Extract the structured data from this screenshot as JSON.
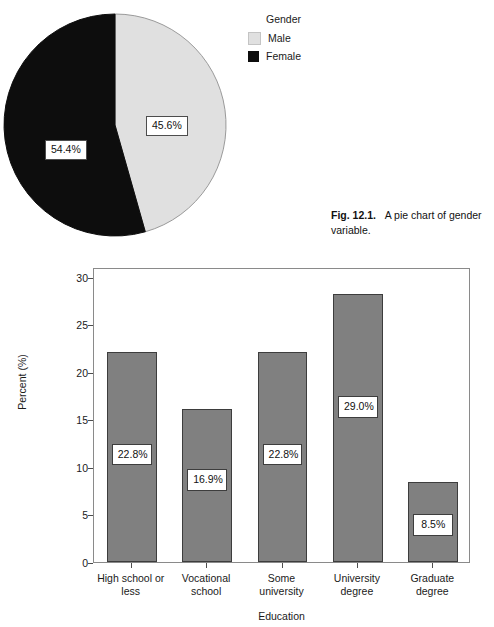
{
  "pie_figure": {
    "legend": {
      "title": "Gender",
      "entries": [
        {
          "label": "Male",
          "color": "#e0e0e0"
        },
        {
          "label": "Female",
          "color": "#0d0d0d"
        }
      ]
    },
    "slice_labels": {
      "female": "54.4%",
      "male": "45.6%"
    },
    "caption": {
      "number": "Fig. 12.1.",
      "text": "A pie chart of gender variable."
    }
  },
  "bar_figure": {
    "y_axis_title": "Percent (%)",
    "x_axis_title": "Education",
    "y_ticks": [
      "0",
      "5",
      "10",
      "15",
      "20",
      "25",
      "30"
    ]
  },
  "chart_data": [
    {
      "type": "pie",
      "title": "",
      "labels": [
        "Male",
        "Female"
      ],
      "values": [
        45.6,
        54.4
      ],
      "value_labels": [
        "45.6%",
        "54.4%"
      ],
      "colors": [
        "#e0e0e0",
        "#0d0d0d"
      ],
      "legend_title": "Gender",
      "legend_position": "right",
      "start_angle_deg": 0,
      "direction": "clockwise",
      "units": "percent"
    },
    {
      "type": "bar",
      "title": "",
      "categories": [
        "High school or less",
        "Vocational school",
        "Some university",
        "University degree",
        "Graduate degree"
      ],
      "category_lines": [
        [
          "High school or",
          "less"
        ],
        [
          "Vocational",
          "school"
        ],
        [
          "Some",
          "university"
        ],
        [
          "University",
          "degree"
        ],
        [
          "Graduate",
          "degree"
        ]
      ],
      "values": [
        22.1,
        16.1,
        22.1,
        28.2,
        8.4
      ],
      "value_labels": [
        "22.8%",
        "16.9%",
        "22.8%",
        "29.0%",
        "8.5%"
      ],
      "label_y_positions": [
        11.7,
        9.0,
        11.7,
        16.7,
        4.3
      ],
      "xlabel": "Education",
      "ylabel": "Percent (%)",
      "ylim": [
        0,
        31
      ],
      "yticks": [
        0,
        5,
        10,
        15,
        20,
        25,
        30
      ],
      "grid": false,
      "bar_color": "#808080",
      "bar_edge_color": "#3d3d3d",
      "legend": false
    }
  ]
}
